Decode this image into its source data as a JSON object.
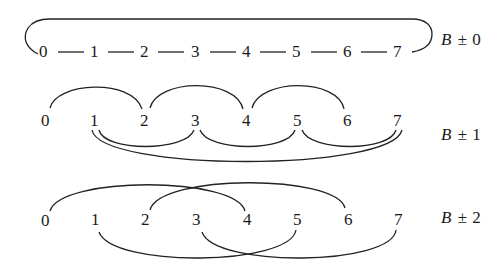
{
  "diagram": {
    "nodes": [
      "0",
      "1",
      "2",
      "3",
      "4",
      "5",
      "6",
      "7"
    ],
    "rows": [
      {
        "label_var": "B",
        "label_op": "±",
        "label_num": "0",
        "label": "B ± 0",
        "connections": "chain 0—1—2—3—4—5—6—7 with wrap-around arc 7→0",
        "edges": [
          [
            0,
            1
          ],
          [
            1,
            2
          ],
          [
            2,
            3
          ],
          [
            3,
            4
          ],
          [
            4,
            5
          ],
          [
            5,
            6
          ],
          [
            6,
            7
          ],
          [
            7,
            0
          ]
        ]
      },
      {
        "label_var": "B",
        "label_op": "±",
        "label_num": "1",
        "label": "B ± 1",
        "connections": "upper arcs 0-2, 2-4, 4-6; lower arcs 1-3, 3-5, 5-7; long lower arc 1-7",
        "edges": [
          [
            0,
            2
          ],
          [
            2,
            4
          ],
          [
            4,
            6
          ],
          [
            1,
            3
          ],
          [
            3,
            5
          ],
          [
            5,
            7
          ],
          [
            1,
            7
          ]
        ]
      },
      {
        "label_var": "B",
        "label_op": "±",
        "label_num": "2",
        "label": "B ± 2",
        "connections": "upper arcs 0-4, 2-6; lower arcs 1-5, 3-7",
        "edges": [
          [
            0,
            4
          ],
          [
            2,
            6
          ],
          [
            1,
            5
          ],
          [
            3,
            7
          ]
        ]
      }
    ]
  }
}
